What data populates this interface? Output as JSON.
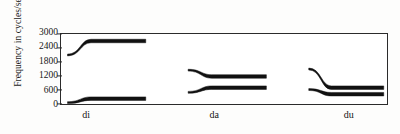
{
  "chart_data": {
    "type": "line",
    "title": "",
    "xlabel": "",
    "ylabel": "Frequency in cycles/second",
    "ylim": [
      0,
      3000
    ],
    "yticks": [
      0,
      600,
      1200,
      1800,
      2400,
      3000
    ],
    "ytick_labels": [
      "0",
      "600",
      "1200",
      "1800",
      "2400",
      "3000"
    ],
    "categories": [
      "di",
      "da",
      "du"
    ],
    "grid": false,
    "legend": false,
    "annotations": [],
    "series": [
      {
        "name": "di-second-formant",
        "syllable": "di",
        "formant": 2,
        "onset_hz": 2100,
        "steady_hz": 2700,
        "transition": "rising",
        "x_start_pct": 2,
        "x_end_pct": 26
      },
      {
        "name": "di-first-formant",
        "syllable": "di",
        "formant": 1,
        "onset_hz": 60,
        "steady_hz": 230,
        "transition": "rising",
        "x_start_pct": 2,
        "x_end_pct": 26
      },
      {
        "name": "da-second-formant",
        "syllable": "da",
        "formant": 2,
        "onset_hz": 1450,
        "steady_hz": 1180,
        "transition": "falling",
        "x_start_pct": 39,
        "x_end_pct": 63
      },
      {
        "name": "da-first-formant",
        "syllable": "da",
        "formant": 1,
        "onset_hz": 500,
        "steady_hz": 700,
        "transition": "rising",
        "x_start_pct": 39,
        "x_end_pct": 63
      },
      {
        "name": "du-second-formant",
        "syllable": "du",
        "formant": 2,
        "onset_hz": 1500,
        "steady_hz": 700,
        "transition": "falling",
        "x_start_pct": 76,
        "x_end_pct": 99
      },
      {
        "name": "du-first-formant",
        "syllable": "du",
        "formant": 1,
        "onset_hz": 620,
        "steady_hz": 420,
        "transition": "falling",
        "x_start_pct": 76,
        "x_end_pct": 99
      }
    ]
  },
  "axis": {
    "y_title": "Frequency in cycles/second",
    "y_tick_0": "0",
    "y_tick_1": "600",
    "y_tick_2": "1200",
    "y_tick_3": "1800",
    "y_tick_4": "2400",
    "y_tick_5": "3000",
    "x_label_1": "di",
    "x_label_2": "da",
    "x_label_3": "du"
  },
  "colors": {
    "trace": "#111111",
    "frame": "#2b2b2b",
    "text": "#161616",
    "background": "#fdfdfc"
  }
}
